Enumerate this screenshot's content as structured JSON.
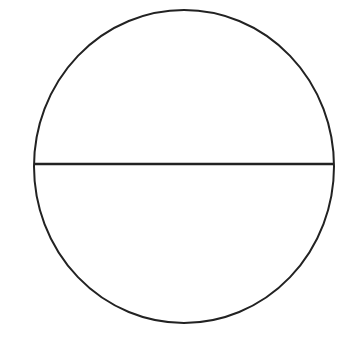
{
  "diagram": {
    "shape": "circle-with-diameter",
    "stroke_color": "#222222",
    "background": "#ffffff",
    "circle": {
      "cx": 184,
      "cy": 166.5,
      "rx": 150,
      "ry": 156.5,
      "stroke_width": 2
    },
    "diameter": {
      "x1": 34,
      "y1": 164,
      "x2": 334,
      "y2": 164,
      "stroke_width": 2.5
    }
  }
}
